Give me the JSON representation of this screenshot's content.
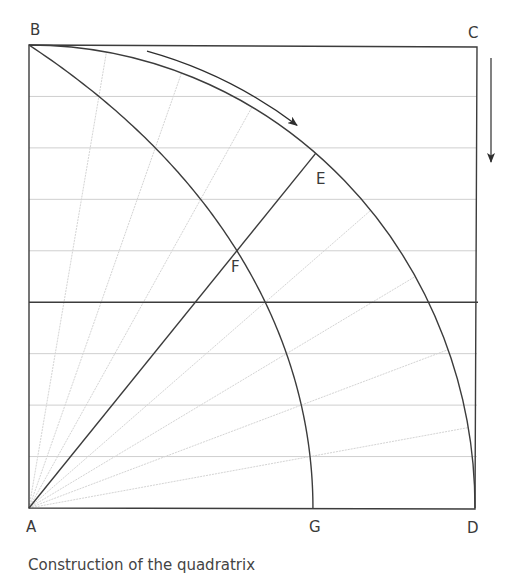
{
  "diagram": {
    "type": "geometric construction (quadratrix of Hippias)",
    "colors": {
      "main_line": "#3c3c3c",
      "grid_line": "#cfcfcf",
      "ray_line": "#d4d4d4",
      "label": "#3a3a3a"
    },
    "square": {
      "A": [
        29,
        508
      ],
      "B": [
        29,
        45
      ],
      "C": [
        477,
        47
      ],
      "D": [
        475,
        509
      ]
    },
    "grid": {
      "divisions": 9,
      "ray_step_degrees": 10,
      "solid_horizontal_index": 4
    },
    "labels": [
      {
        "id": "B",
        "text": "B",
        "x": 30,
        "y": 35
      },
      {
        "id": "C",
        "text": "C",
        "x": 468,
        "y": 38
      },
      {
        "id": "E",
        "text": "E",
        "x": 316,
        "y": 184
      },
      {
        "id": "F",
        "text": "F",
        "x": 231,
        "y": 272
      },
      {
        "id": "A",
        "text": "A",
        "x": 26,
        "y": 532
      },
      {
        "id": "G",
        "text": "G",
        "x": 309,
        "y": 532
      },
      {
        "id": "D",
        "text": "D",
        "x": 467,
        "y": 533
      }
    ],
    "points": {
      "E": [
        315,
        156
      ],
      "F": [
        237,
        250
      ],
      "G": [
        316,
        508
      ]
    },
    "arrows": [
      {
        "name": "rotation-arrow",
        "description": "curved arrow along arc from B toward E"
      },
      {
        "name": "descent-arrow",
        "description": "vertical arrow right of side CD pointing down"
      }
    ]
  },
  "caption": {
    "text": "Construction of the quadratrix"
  }
}
